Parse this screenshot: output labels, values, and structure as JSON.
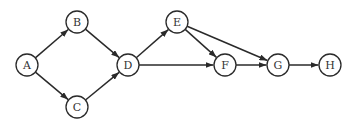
{
  "diagram": {
    "type": "directed-graph",
    "node_radius": 11,
    "colors": {
      "stroke": "#2a2a2a",
      "fill": "#ffffff",
      "label": "#333333"
    },
    "nodes": [
      {
        "id": "A",
        "label": "A",
        "x": 27,
        "y": 65
      },
      {
        "id": "B",
        "label": "B",
        "x": 77,
        "y": 22
      },
      {
        "id": "C",
        "label": "C",
        "x": 77,
        "y": 107
      },
      {
        "id": "D",
        "label": "D",
        "x": 128,
        "y": 65
      },
      {
        "id": "E",
        "label": "E",
        "x": 177,
        "y": 22
      },
      {
        "id": "F",
        "label": "F",
        "x": 225,
        "y": 65
      },
      {
        "id": "G",
        "label": "G",
        "x": 278,
        "y": 65
      },
      {
        "id": "H",
        "label": "H",
        "x": 330,
        "y": 65
      }
    ],
    "edges": [
      {
        "from": "A",
        "to": "B"
      },
      {
        "from": "A",
        "to": "C"
      },
      {
        "from": "B",
        "to": "D"
      },
      {
        "from": "C",
        "to": "D"
      },
      {
        "from": "D",
        "to": "E"
      },
      {
        "from": "D",
        "to": "F"
      },
      {
        "from": "E",
        "to": "F"
      },
      {
        "from": "E",
        "to": "G"
      },
      {
        "from": "F",
        "to": "G"
      },
      {
        "from": "G",
        "to": "H"
      }
    ]
  }
}
